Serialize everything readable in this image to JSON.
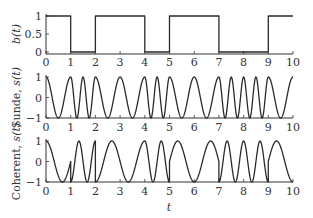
{
  "chart_data": [
    {
      "type": "line",
      "name": "bit-sequence",
      "ylabel": "b(t)",
      "xlabel": "",
      "xlim": [
        0,
        10
      ],
      "ylim": [
        0,
        1
      ],
      "xticks": [
        0,
        1,
        2,
        3,
        4,
        5,
        6,
        7,
        8,
        9,
        10
      ],
      "yticks": [
        0,
        0.5,
        1
      ],
      "ytick_labels": [
        "0",
        "0.5",
        "1"
      ],
      "step": true,
      "bit_intervals": [
        [
          0,
          1,
          1
        ],
        [
          1,
          2,
          0
        ],
        [
          2,
          4,
          1
        ],
        [
          4,
          5,
          0
        ],
        [
          5,
          7,
          1
        ],
        [
          7,
          9,
          0
        ],
        [
          9,
          10,
          1
        ]
      ],
      "bits": [
        1,
        0,
        1,
        1,
        0,
        1,
        1,
        0,
        0,
        1
      ]
    },
    {
      "type": "line",
      "name": "sunde-fsk",
      "ylabel": "Sunde, s(t)",
      "xlabel": "",
      "xlim": [
        0,
        10
      ],
      "ylim": [
        -1,
        1
      ],
      "xticks": [
        0,
        1,
        2,
        3,
        4,
        5,
        6,
        7,
        8,
        9,
        10
      ],
      "yticks": [
        -1,
        0,
        1
      ],
      "ytick_labels": [
        "-1",
        "0",
        "1"
      ],
      "model": "s(t) = cos(2*pi*f*t); f = 1 when b=1, f = 2 when b=0",
      "freq_bit1": 1,
      "freq_bit0": 2
    },
    {
      "type": "line",
      "name": "coherent-fsk",
      "ylabel": "Coherent, s(t)",
      "xlabel": "t",
      "xlim": [
        0,
        10
      ],
      "ylim": [
        -1,
        1
      ],
      "xticks": [
        0,
        1,
        2,
        3,
        4,
        5,
        6,
        7,
        8,
        9,
        10
      ],
      "yticks": [
        -1,
        0,
        1
      ],
      "ytick_labels": [
        "-1",
        "0",
        "1"
      ],
      "model": "s(t) = cos(2*pi*f*t); f = 0.75 when b=1, f = 1.5 when b=0",
      "freq_bit1": 0.75,
      "freq_bit0": 1.5
    }
  ],
  "labels": {
    "top_ylabel": "b(t)",
    "mid_ylabel": "Sunde, s(t)",
    "bot_ylabel": "Coherent, s(t)",
    "xlabel": "t"
  },
  "colors": {
    "line": "#2a2a2a",
    "axis": "#333333",
    "background": "#ffffff"
  }
}
